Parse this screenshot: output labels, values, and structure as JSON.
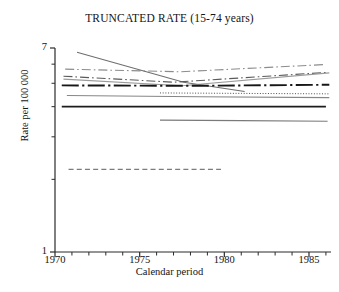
{
  "chart_data": {
    "type": "line",
    "title": "TRUNCATED RATE (15-74 years)",
    "xlabel": "Calendar period",
    "ylabel": "Rate per 100 000",
    "yscale": "log",
    "ylim": [
      1,
      7
    ],
    "xlim": [
      1970,
      1986.3
    ],
    "grid": false,
    "legend": "none",
    "y_tick_labels": [
      "7",
      "1"
    ],
    "y_ticks_major": [
      7,
      1
    ],
    "y_ticks_minor": [
      6,
      5,
      4,
      3,
      2
    ],
    "x_tick_labels": [
      "1970",
      "1975",
      "1980",
      "1985"
    ],
    "x_ticks_major": [
      1970,
      1975,
      1980,
      1985
    ],
    "x_ticks_minor": [
      1971,
      1972,
      1973,
      1974,
      1976,
      1977,
      1978,
      1979,
      1981,
      1982,
      1983,
      1984,
      1986
    ],
    "series": [
      {
        "name": "series-1",
        "style": "dash-dot",
        "color": "#8c8c8c",
        "width": 1.1,
        "x": [
          1970.6,
          1977.4,
          1986.0
        ],
        "y": [
          5.72,
          5.58,
          5.98
        ]
      },
      {
        "name": "series-2",
        "style": "solid",
        "color": "#6e6e6e",
        "width": 1.1,
        "x": [
          1971.3,
          1977.6,
          1981.2
        ],
        "y": [
          6.72,
          5.05,
          4.62
        ]
      },
      {
        "name": "series-3",
        "style": "dash-dot",
        "color": "#5a5a5a",
        "width": 1.1,
        "x": [
          1970.5,
          1977.0,
          1986.1
        ],
        "y": [
          5.35,
          5.05,
          5.55
        ]
      },
      {
        "name": "series-4",
        "style": "solid",
        "color": "#9a9a9a",
        "width": 1.1,
        "x": [
          1970.5,
          1977.5,
          1986.2
        ],
        "y": [
          5.2,
          4.88,
          5.52
        ]
      },
      {
        "name": "series-5",
        "style": "dash-dot-long",
        "color": "#171717",
        "width": 1.9,
        "x": [
          1970.4,
          1978.0,
          1986.2
        ],
        "y": [
          4.9,
          4.88,
          4.93
        ]
      },
      {
        "name": "series-6",
        "style": "dotted",
        "color": "#4d4d4d",
        "width": 1.0,
        "x": [
          1976.2,
          1981.0,
          1986.2
        ],
        "y": [
          4.56,
          4.54,
          4.52
        ]
      },
      {
        "name": "series-7",
        "style": "solid",
        "color": "#868686",
        "width": 1.1,
        "x": [
          1970.7,
          1978.5,
          1986.2
        ],
        "y": [
          4.45,
          4.4,
          4.36
        ]
      },
      {
        "name": "series-8",
        "style": "solid",
        "color": "#1c1c1c",
        "width": 1.6,
        "x": [
          1970.4,
          1978.0,
          1986.0
        ],
        "y": [
          4.0,
          4.0,
          4.0
        ]
      },
      {
        "name": "series-9",
        "style": "solid",
        "color": "#7a7a7a",
        "width": 1.2,
        "x": [
          1976.2,
          1981.0,
          1986.1
        ],
        "y": [
          3.52,
          3.5,
          3.48
        ]
      },
      {
        "name": "series-10",
        "style": "dashed",
        "color": "#7c7c7c",
        "width": 1.4,
        "x": [
          1970.8,
          1976.0,
          1979.8
        ],
        "y": [
          2.2,
          2.2,
          2.2
        ]
      }
    ],
    "axis_color": "#2b2b2b"
  }
}
